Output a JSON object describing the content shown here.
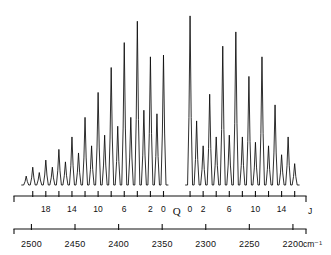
{
  "figure": {
    "title": "",
    "kind": "rovibrational-infrared-spectrum"
  },
  "j_axis": {
    "name": "J",
    "unit_label": "J",
    "q_branch_label": "Q",
    "p_branch_labels": [
      "18",
      "14",
      "10",
      "6",
      "2",
      "0"
    ],
    "r_branch_labels": [
      "0",
      "2",
      "6",
      "10",
      "14"
    ],
    "tick_j_values_p": [
      20,
      18,
      16,
      14,
      12,
      10,
      8,
      6,
      4,
      2,
      0
    ],
    "tick_j_values_r": [
      0,
      2,
      4,
      6,
      8,
      10,
      12,
      14,
      16
    ]
  },
  "wavenumber_axis": {
    "unit_label": "cm⁻¹",
    "tick_labels": [
      "2500",
      "2450",
      "2400",
      "2350",
      "2300",
      "2250",
      "2200"
    ],
    "tick_values": [
      2500,
      2450,
      2400,
      2350,
      2300,
      2250,
      2200
    ],
    "min": 2200,
    "max": 2500
  },
  "chart_data": {
    "type": "line",
    "title": "",
    "xlabel": "cm⁻¹",
    "ylabel": "",
    "xlim": [
      2520,
      2185
    ],
    "ylim": [
      0,
      1
    ],
    "grid": false,
    "legend": null,
    "peak_spacing_cm1": 9.4,
    "baseline": 0.0,
    "series": [
      {
        "name": "P-branch",
        "branch": "P",
        "x": [
          2506.0,
          2498.5,
          2491.0,
          2483.5,
          2476.0,
          2468.5,
          2461.0,
          2453.5,
          2446.0,
          2438.5,
          2431.0,
          2423.5,
          2416.0,
          2408.5,
          2401.0,
          2393.5,
          2386.0,
          2378.5,
          2371.0,
          2363.5,
          2356.0,
          2348.5
        ],
        "j": [
          21,
          20,
          19,
          18,
          17,
          16,
          15,
          14,
          13,
          12,
          11,
          10,
          9,
          8,
          7,
          6,
          5,
          4,
          3,
          2,
          1,
          0
        ],
        "values": [
          0.05,
          0.1,
          0.07,
          0.14,
          0.1,
          0.2,
          0.13,
          0.27,
          0.18,
          0.38,
          0.22,
          0.52,
          0.28,
          0.66,
          0.33,
          0.8,
          0.38,
          0.92,
          0.42,
          0.72,
          0.4,
          0.73
        ]
      },
      {
        "name": "R-branch",
        "branch": "R",
        "x": [
          2318.0,
          2310.5,
          2303.0,
          2295.5,
          2288.0,
          2280.5,
          2273.0,
          2265.5,
          2258.0,
          2250.5,
          2243.0,
          2235.5,
          2228.0,
          2220.5,
          2213.0,
          2205.5,
          2198.0
        ],
        "j": [
          0,
          1,
          2,
          3,
          4,
          5,
          6,
          7,
          8,
          9,
          10,
          11,
          12,
          13,
          14,
          15,
          16
        ],
        "values": [
          0.95,
          0.36,
          0.22,
          0.51,
          0.27,
          0.78,
          0.28,
          0.86,
          0.27,
          0.61,
          0.24,
          0.72,
          0.22,
          0.45,
          0.17,
          0.27,
          0.12
        ]
      }
    ]
  }
}
